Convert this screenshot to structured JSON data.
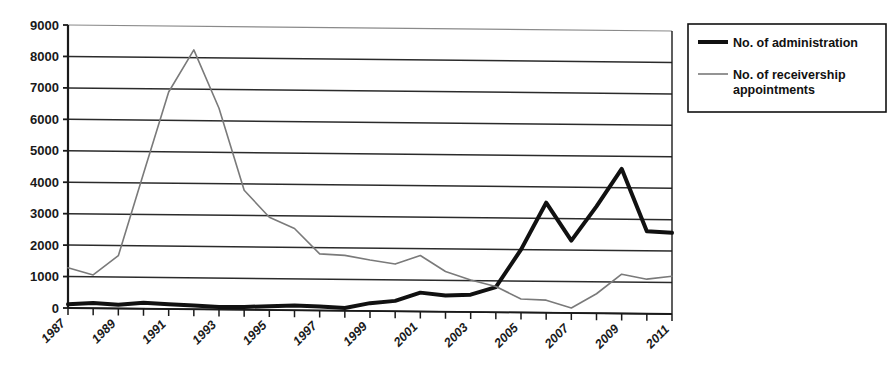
{
  "chart_data": {
    "type": "line",
    "title": "",
    "xlabel": "",
    "ylabel": "",
    "ylim": [
      0,
      9000
    ],
    "ytick_step": 1000,
    "grid": true,
    "legend_position": "right",
    "x": [
      1987,
      1988,
      1989,
      1990,
      1991,
      1992,
      1993,
      1994,
      1995,
      1996,
      1997,
      1998,
      1999,
      2000,
      2001,
      2002,
      2003,
      2004,
      2005,
      2006,
      2007,
      2008,
      2009,
      2010,
      2011
    ],
    "xtick_labels": [
      "1987",
      "1989",
      "1991",
      "1993",
      "1995",
      "1997",
      "1999",
      "2001",
      "2003",
      "2005",
      "2007",
      "2009",
      "2011"
    ],
    "ytick_labels": [
      "0",
      "1000",
      "2000",
      "3000",
      "4000",
      "5000",
      "6000",
      "7000",
      "8000",
      "9000"
    ],
    "series": [
      {
        "name": "No. of administration",
        "color": "#111111",
        "width": 4,
        "values": [
          120,
          170,
          120,
          190,
          150,
          120,
          80,
          90,
          120,
          150,
          130,
          90,
          250,
          330,
          600,
          520,
          550,
          800,
          2000,
          3500,
          2300,
          3400,
          4600,
          2620,
          2580
        ]
      },
      {
        "name": "No. of receivership appointments",
        "color": "#7a7a7a",
        "width": 1.6,
        "values": [
          1280,
          1060,
          1680,
          4300,
          6900,
          8250,
          6400,
          3800,
          2950,
          2600,
          1800,
          1760,
          1620,
          1500,
          1780,
          1280,
          1020,
          820,
          430,
          400,
          160,
          620,
          1250,
          1100,
          1200
        ]
      }
    ]
  },
  "legend": {
    "items": [
      {
        "label": "No. of administration",
        "swatch": "thick-black-line"
      },
      {
        "label": "No. of receivership appointments",
        "swatch": "thin-gray-line"
      }
    ]
  },
  "colors": {
    "administration": "#111111",
    "receivership": "#7a7a7a",
    "axis": "#1a1a1a",
    "grid": "#2b2b2b",
    "background": "#ffffff"
  }
}
